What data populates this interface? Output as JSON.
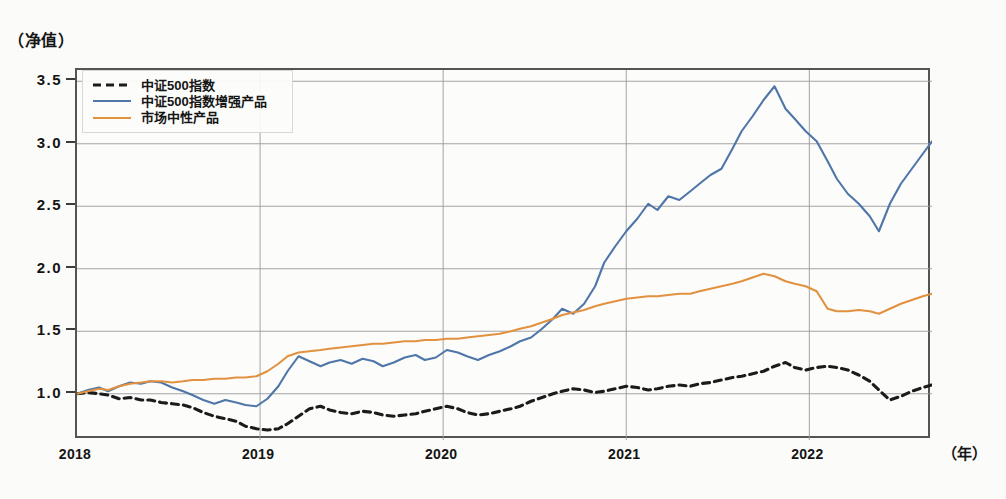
{
  "axes": {
    "y_title": "（净值）",
    "x_title": "（年）",
    "y_ticks": [
      "3.5",
      "3.0",
      "2.5",
      "2.0",
      "1.5",
      "1.0"
    ],
    "x_ticks": [
      "2018",
      "2019",
      "2020",
      "2021",
      "2022"
    ]
  },
  "legend": {
    "items": [
      {
        "label": "中证500指数",
        "style": "dashed",
        "color": "#1b1b1b"
      },
      {
        "label": "中证500指数增强产品",
        "style": "solid",
        "color": "#4f76a8"
      },
      {
        "label": "市场中性产品",
        "style": "solid",
        "color": "#e1913f"
      }
    ]
  },
  "chart_data": {
    "type": "line",
    "title": "",
    "xlabel": "（年）",
    "ylabel": "（净值）",
    "xlim": [
      2018.0,
      2022.67
    ],
    "ylim": [
      0.63,
      3.59
    ],
    "grid": true,
    "legend_position": "top-left",
    "x_tick_values": [
      2018,
      2019,
      2020,
      2021,
      2022
    ],
    "y_tick_values": [
      1.0,
      1.5,
      2.0,
      2.5,
      3.0,
      3.5
    ],
    "series": [
      {
        "name": "中证500指数",
        "color": "#1b1b1b",
        "style": "dashed",
        "x": [
          2018.0,
          2018.06,
          2018.12,
          2018.17,
          2018.23,
          2018.29,
          2018.35,
          2018.4,
          2018.46,
          2018.52,
          2018.58,
          2018.63,
          2018.69,
          2018.75,
          2018.81,
          2018.87,
          2018.92,
          2018.98,
          2019.04,
          2019.1,
          2019.15,
          2019.21,
          2019.27,
          2019.33,
          2019.38,
          2019.44,
          2019.5,
          2019.56,
          2019.62,
          2019.67,
          2019.73,
          2019.79,
          2019.85,
          2019.9,
          2019.96,
          2020.02,
          2020.08,
          2020.13,
          2020.19,
          2020.25,
          2020.31,
          2020.37,
          2020.42,
          2020.48,
          2020.54,
          2020.6,
          2020.65,
          2020.71,
          2020.77,
          2020.83,
          2020.88,
          2020.94,
          2021.0,
          2021.06,
          2021.12,
          2021.17,
          2021.23,
          2021.29,
          2021.35,
          2021.4,
          2021.46,
          2021.52,
          2021.58,
          2021.63,
          2021.69,
          2021.75,
          2021.81,
          2021.87,
          2021.92,
          2021.98,
          2022.04,
          2022.1,
          2022.15,
          2022.21,
          2022.27,
          2022.33,
          2022.38,
          2022.44,
          2022.5,
          2022.56,
          2022.62,
          2022.67
        ],
        "y": [
          1.0,
          1.01,
          1.0,
          0.99,
          0.96,
          0.97,
          0.95,
          0.95,
          0.93,
          0.92,
          0.91,
          0.89,
          0.85,
          0.82,
          0.8,
          0.78,
          0.74,
          0.72,
          0.71,
          0.72,
          0.76,
          0.82,
          0.88,
          0.9,
          0.87,
          0.85,
          0.84,
          0.86,
          0.85,
          0.83,
          0.82,
          0.83,
          0.84,
          0.86,
          0.88,
          0.9,
          0.88,
          0.85,
          0.83,
          0.84,
          0.86,
          0.88,
          0.9,
          0.94,
          0.97,
          1.0,
          1.02,
          1.04,
          1.03,
          1.01,
          1.02,
          1.04,
          1.06,
          1.05,
          1.03,
          1.04,
          1.06,
          1.07,
          1.06,
          1.08,
          1.09,
          1.11,
          1.13,
          1.14,
          1.16,
          1.18,
          1.22,
          1.25,
          1.21,
          1.19,
          1.21,
          1.22,
          1.21,
          1.19,
          1.15,
          1.1,
          1.03,
          0.95,
          0.98,
          1.02,
          1.05,
          1.07
        ]
      },
      {
        "name": "中证500指数增强产品",
        "color": "#4f76a8",
        "style": "solid",
        "x": [
          2018.0,
          2018.06,
          2018.12,
          2018.17,
          2018.23,
          2018.29,
          2018.35,
          2018.4,
          2018.46,
          2018.52,
          2018.58,
          2018.63,
          2018.69,
          2018.75,
          2018.81,
          2018.87,
          2018.92,
          2018.98,
          2019.04,
          2019.1,
          2019.15,
          2019.21,
          2019.27,
          2019.33,
          2019.38,
          2019.44,
          2019.5,
          2019.56,
          2019.62,
          2019.67,
          2019.73,
          2019.79,
          2019.85,
          2019.9,
          2019.96,
          2020.02,
          2020.08,
          2020.13,
          2020.19,
          2020.25,
          2020.31,
          2020.37,
          2020.42,
          2020.48,
          2020.54,
          2020.6,
          2020.65,
          2020.71,
          2020.77,
          2020.83,
          2020.88,
          2020.94,
          2021.0,
          2021.06,
          2021.12,
          2021.17,
          2021.23,
          2021.29,
          2021.35,
          2021.4,
          2021.46,
          2021.52,
          2021.58,
          2021.63,
          2021.69,
          2021.75,
          2021.81,
          2021.87,
          2021.92,
          2021.98,
          2022.04,
          2022.1,
          2022.15,
          2022.21,
          2022.27,
          2022.33,
          2022.38,
          2022.44,
          2022.5,
          2022.56,
          2022.62,
          2022.67
        ],
        "y": [
          1.0,
          1.03,
          1.05,
          1.02,
          1.06,
          1.09,
          1.08,
          1.1,
          1.09,
          1.05,
          1.02,
          0.99,
          0.95,
          0.92,
          0.95,
          0.93,
          0.91,
          0.9,
          0.96,
          1.06,
          1.18,
          1.3,
          1.26,
          1.22,
          1.25,
          1.27,
          1.24,
          1.28,
          1.26,
          1.22,
          1.25,
          1.29,
          1.31,
          1.27,
          1.29,
          1.35,
          1.33,
          1.3,
          1.27,
          1.31,
          1.34,
          1.38,
          1.42,
          1.45,
          1.52,
          1.6,
          1.68,
          1.64,
          1.72,
          1.86,
          2.05,
          2.18,
          2.3,
          2.4,
          2.52,
          2.47,
          2.58,
          2.55,
          2.62,
          2.68,
          2.75,
          2.8,
          2.96,
          3.1,
          3.22,
          3.35,
          3.46,
          3.28,
          3.2,
          3.1,
          3.02,
          2.86,
          2.72,
          2.6,
          2.52,
          2.42,
          2.3,
          2.52,
          2.68,
          2.8,
          2.92,
          3.02
        ]
      },
      {
        "name": "市场中性产品",
        "color": "#e1913f",
        "style": "solid",
        "x": [
          2018.0,
          2018.06,
          2018.12,
          2018.17,
          2018.23,
          2018.29,
          2018.35,
          2018.4,
          2018.46,
          2018.52,
          2018.58,
          2018.63,
          2018.69,
          2018.75,
          2018.81,
          2018.87,
          2018.92,
          2018.98,
          2019.04,
          2019.1,
          2019.15,
          2019.21,
          2019.27,
          2019.33,
          2019.38,
          2019.44,
          2019.5,
          2019.56,
          2019.62,
          2019.67,
          2019.73,
          2019.79,
          2019.85,
          2019.9,
          2019.96,
          2020.02,
          2020.08,
          2020.13,
          2020.19,
          2020.25,
          2020.31,
          2020.37,
          2020.42,
          2020.48,
          2020.54,
          2020.6,
          2020.65,
          2020.71,
          2020.77,
          2020.83,
          2020.88,
          2020.94,
          2021.0,
          2021.06,
          2021.12,
          2021.17,
          2021.23,
          2021.29,
          2021.35,
          2021.4,
          2021.46,
          2021.52,
          2021.58,
          2021.63,
          2021.69,
          2021.75,
          2021.81,
          2021.87,
          2021.92,
          2021.98,
          2022.04,
          2022.1,
          2022.15,
          2022.21,
          2022.27,
          2022.33,
          2022.38,
          2022.44,
          2022.5,
          2022.56,
          2022.62,
          2022.67
        ],
        "y": [
          1.0,
          1.02,
          1.04,
          1.03,
          1.06,
          1.08,
          1.09,
          1.1,
          1.1,
          1.09,
          1.1,
          1.11,
          1.11,
          1.12,
          1.12,
          1.13,
          1.13,
          1.14,
          1.18,
          1.24,
          1.3,
          1.33,
          1.34,
          1.35,
          1.36,
          1.37,
          1.38,
          1.39,
          1.4,
          1.4,
          1.41,
          1.42,
          1.42,
          1.43,
          1.43,
          1.44,
          1.44,
          1.45,
          1.46,
          1.47,
          1.48,
          1.5,
          1.52,
          1.54,
          1.57,
          1.6,
          1.63,
          1.65,
          1.67,
          1.7,
          1.72,
          1.74,
          1.76,
          1.77,
          1.78,
          1.78,
          1.79,
          1.8,
          1.8,
          1.82,
          1.84,
          1.86,
          1.88,
          1.9,
          1.93,
          1.96,
          1.94,
          1.9,
          1.88,
          1.86,
          1.82,
          1.68,
          1.66,
          1.66,
          1.67,
          1.66,
          1.64,
          1.68,
          1.72,
          1.75,
          1.78,
          1.8
        ]
      }
    ]
  }
}
